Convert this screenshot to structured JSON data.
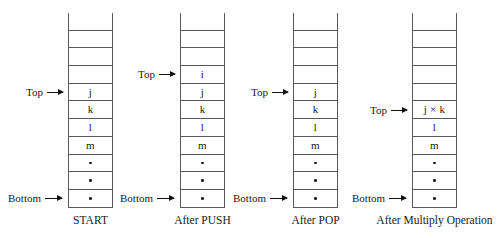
{
  "figure": {
    "ink_color": "#1a1a1a",
    "rule_color": "#595959",
    "background": "#ffffff",
    "dot_glyph": "•"
  },
  "stacks": [
    {
      "id": "start",
      "caption": "START",
      "top_label": "Top",
      "bottom_label": "Bottom",
      "top_index": 4,
      "bottom_index": 10,
      "cells": [
        "",
        "",
        "",
        "",
        "j",
        "k",
        "l",
        "m",
        "•",
        "•",
        "•",
        ""
      ]
    },
    {
      "id": "after-push",
      "caption": "After PUSH",
      "top_label": "Top",
      "bottom_label": "Bottom",
      "top_index": 3,
      "bottom_index": 10,
      "cells": [
        "",
        "",
        "",
        "i",
        "j",
        "k",
        "l",
        "m",
        "•",
        "•",
        "•",
        ""
      ]
    },
    {
      "id": "after-pop",
      "caption": "After POP",
      "top_label": "Top",
      "bottom_label": "Bottom",
      "top_index": 4,
      "bottom_index": 10,
      "cells": [
        "",
        "",
        "",
        "",
        "j",
        "k",
        "l",
        "m",
        "•",
        "•",
        "•",
        ""
      ]
    },
    {
      "id": "after-multiply",
      "caption": "After Multiply Operation",
      "top_label": "Top",
      "bottom_label": "Bottom",
      "top_index": 5,
      "bottom_index": 10,
      "cells": [
        "",
        "",
        "",
        "",
        "",
        "j × k",
        "l",
        "m",
        "•",
        "•",
        "•",
        ""
      ]
    }
  ]
}
